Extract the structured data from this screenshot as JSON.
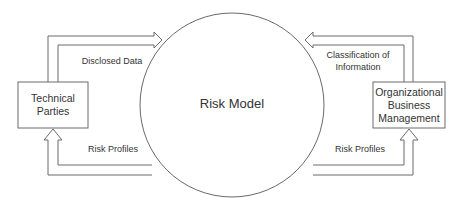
{
  "diagram": {
    "center": {
      "label": "Risk Model"
    },
    "left_box": {
      "lines": [
        "Technical",
        "Parties"
      ]
    },
    "right_box": {
      "lines": [
        "Organizational",
        "Business",
        "Management"
      ]
    },
    "flows": {
      "top_left": "Disclosed Data",
      "bottom_left": "Risk Profiles",
      "top_right_line1": "Classification of",
      "top_right_line2": "Information",
      "bottom_right": "Risk Profiles"
    },
    "colors": {
      "stroke": "#6a6a6a",
      "text": "#333333",
      "background": "#ffffff"
    }
  }
}
